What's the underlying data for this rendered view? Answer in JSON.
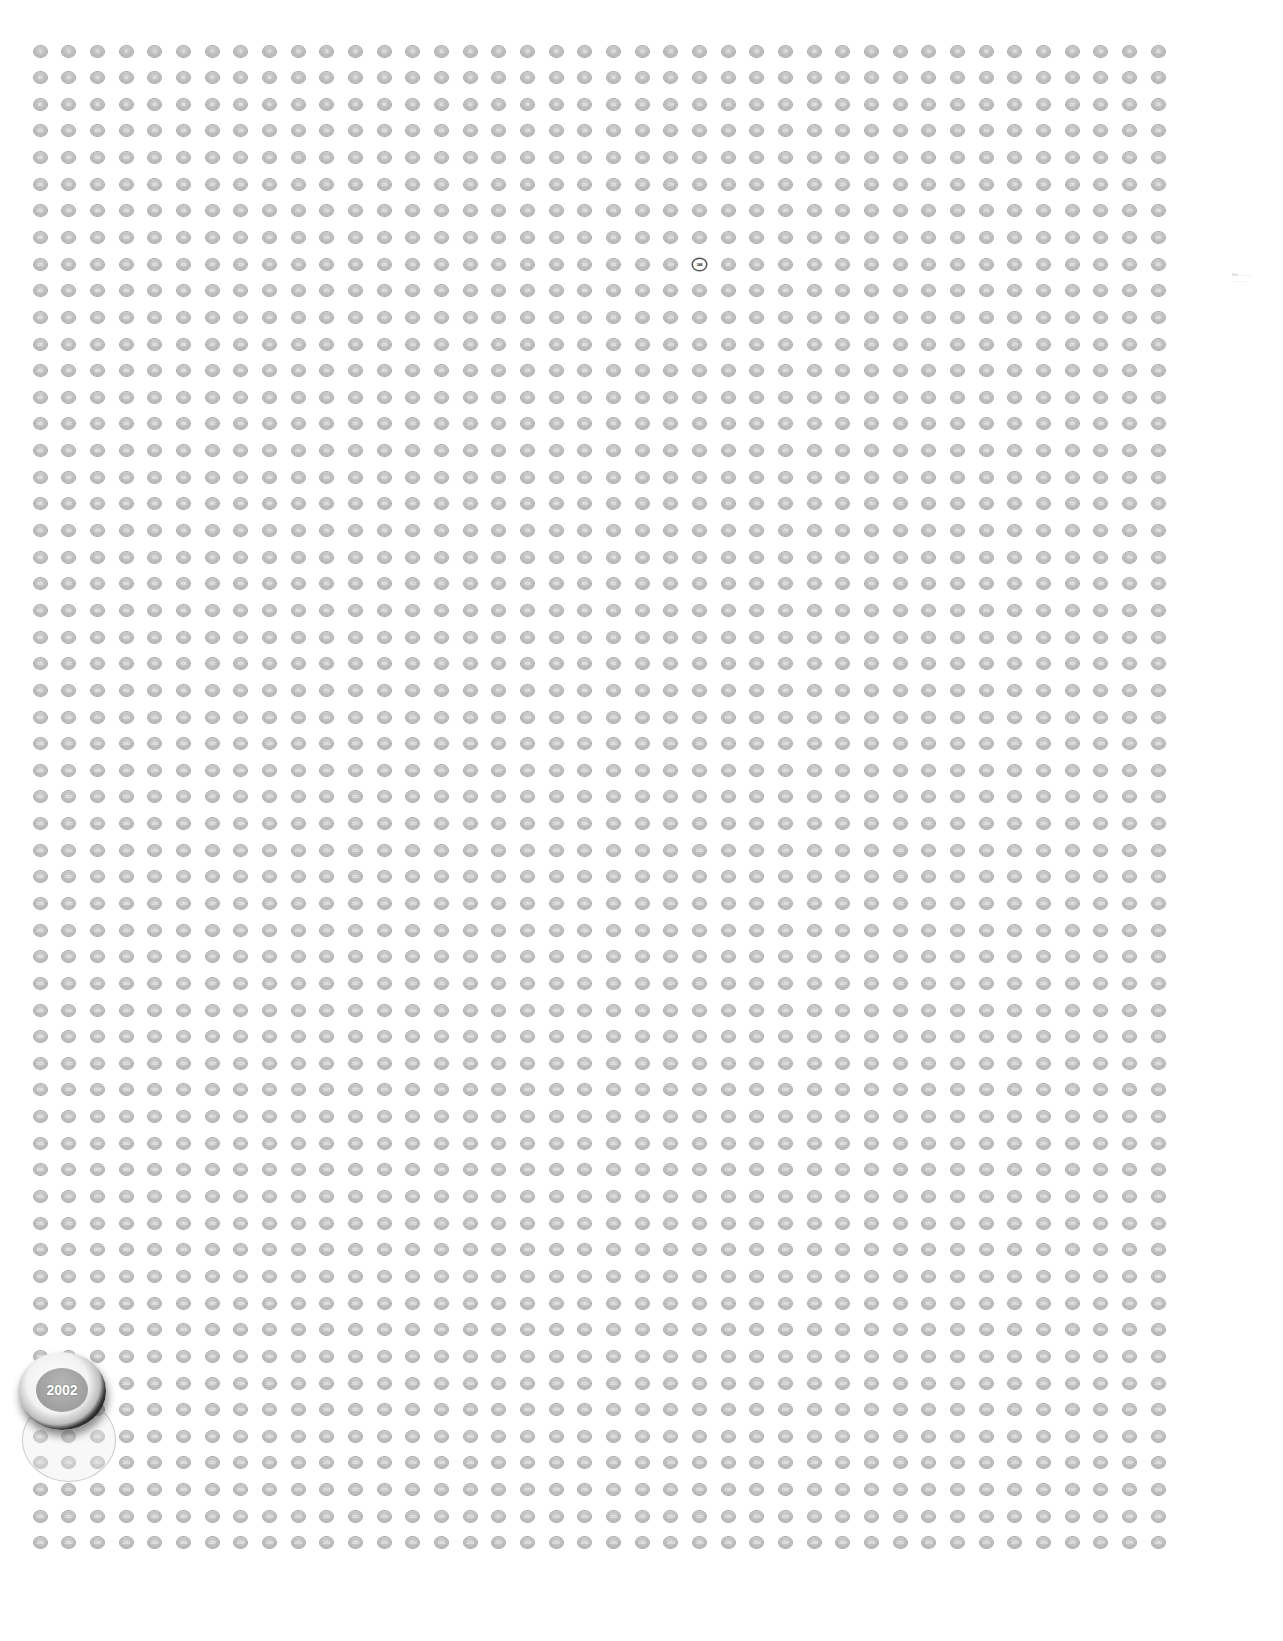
{
  "grid": {
    "columns": 40,
    "rows": 57,
    "start_number": 1,
    "end_number": 2280,
    "origin_x": 40,
    "origin_y": 51,
    "spacing_x": 28.67,
    "spacing_y": 26.64,
    "dot_color": "#b8b8b8",
    "label_color": "#f4f4f4",
    "highlighted_number": 344
  },
  "magnifier": {
    "label": "2002",
    "ring_color": "#111111",
    "inner_color": "#9e9e9e"
  },
  "side_caption": {
    "lines": [
      "Nur ... ... ...",
      "... ... ... ..."
    ]
  }
}
